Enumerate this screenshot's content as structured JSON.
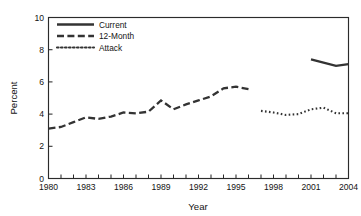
{
  "chart_data": {
    "type": "line",
    "title": "",
    "xlabel": "Year",
    "ylabel": "Percent",
    "xlim": [
      1980,
      2004
    ],
    "ylim": [
      0,
      10
    ],
    "grid": false,
    "legend_position": "top-left",
    "xticks": [
      1980,
      1981,
      1982,
      1983,
      1984,
      1985,
      1986,
      1987,
      1988,
      1989,
      1990,
      1991,
      1992,
      1993,
      1994,
      1995,
      1996,
      1997,
      1998,
      1999,
      2000,
      2001,
      2002,
      2003,
      2004
    ],
    "xtick_labels": [
      "1980",
      "",
      "",
      "1983",
      "",
      "",
      "1986",
      "",
      "",
      "1989",
      "",
      "",
      "1992",
      "",
      "",
      "1995",
      "",
      "",
      "1998",
      "",
      "",
      "2001",
      "",
      "",
      "2004"
    ],
    "ytick_labels": [
      "0",
      "2",
      "4",
      "6",
      "8",
      "10"
    ],
    "yticks": [
      0,
      2,
      4,
      6,
      8,
      10
    ],
    "series": [
      {
        "name": "Current",
        "style": "solid",
        "color": "#333333",
        "x": [
          2001,
          2002,
          2003,
          2004
        ],
        "values": [
          7.4,
          7.2,
          7.0,
          7.1
        ]
      },
      {
        "name": "12-Month",
        "style": "dashed",
        "color": "#333333",
        "x": [
          1980,
          1981,
          1982,
          1983,
          1984,
          1985,
          1986,
          1987,
          1988,
          1989,
          1990,
          1991,
          1992,
          1993,
          1994,
          1995,
          1996
        ],
        "values": [
          3.1,
          3.2,
          3.5,
          3.8,
          3.7,
          3.85,
          4.1,
          4.05,
          4.15,
          4.85,
          4.3,
          4.6,
          4.85,
          5.1,
          5.6,
          5.7,
          5.55
        ]
      },
      {
        "name": "Attack",
        "style": "dotted",
        "color": "#333333",
        "x": [
          1997,
          1998,
          1999,
          2000,
          2001,
          2002,
          2003,
          2004
        ],
        "values": [
          4.2,
          4.1,
          3.95,
          4.0,
          4.3,
          4.4,
          4.05,
          4.05
        ]
      }
    ]
  },
  "axes": {
    "y_title": "Percent",
    "x_title": "Year"
  },
  "legend": {
    "entries": [
      {
        "label": "Current",
        "style": "solid"
      },
      {
        "label": "12-Month",
        "style": "dashed"
      },
      {
        "label": "Attack",
        "style": "dotted"
      }
    ]
  }
}
